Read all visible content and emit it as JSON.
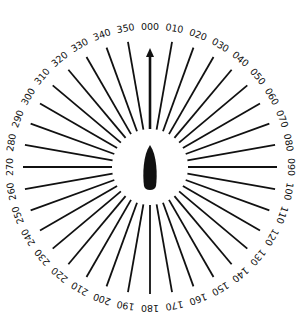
{
  "diagram": {
    "type": "relative-bearing-compass-rose",
    "center": {
      "x": 150,
      "y": 167
    },
    "inner_radius": 38,
    "outer_radius": 127,
    "label_radius": 141,
    "step_degrees": 10,
    "heading_arrow": {
      "bearing": 0,
      "tip_y": 48,
      "base_y": 129
    },
    "colors": {
      "ink": "#111111",
      "background": "#ffffff"
    },
    "labels": [
      "000",
      "010",
      "020",
      "030",
      "040",
      "050",
      "060",
      "070",
      "080",
      "090",
      "100",
      "110",
      "120",
      "130",
      "140",
      "150",
      "160",
      "170",
      "180",
      "190",
      "200",
      "210",
      "220",
      "230",
      "240",
      "250",
      "260",
      "270",
      "280",
      "290",
      "300",
      "310",
      "320",
      "330",
      "340",
      "350"
    ],
    "center_icon": "ship-silhouette-icon"
  }
}
